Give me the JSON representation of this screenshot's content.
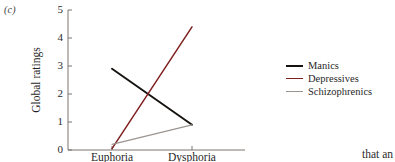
{
  "panel": {
    "label": "(c)"
  },
  "body_fragment": {
    "text": "that an"
  },
  "legend": {
    "position": "right",
    "items": [
      {
        "label": "Manics",
        "color": "#15120f",
        "key": "manics"
      },
      {
        "label": "Depressives",
        "color": "#7e2020",
        "key": "depressives"
      },
      {
        "label": "Schizophrenics",
        "color": "#9a9590",
        "key": "schizophrenics"
      }
    ]
  },
  "chart_data": {
    "type": "line",
    "title": "",
    "subtitle": "",
    "xlabel": "",
    "ylabel": "Global ratings",
    "categories": [
      "Euphoria",
      "Dysphoria"
    ],
    "x_tick_labels": [
      "Euphoria",
      "Dysphoria"
    ],
    "y_tick_labels": [
      "0",
      "1",
      "2",
      "3",
      "4",
      "5"
    ],
    "yticks": [
      0,
      1,
      2,
      3,
      4,
      5
    ],
    "ylim": [
      0,
      5
    ],
    "xlim": [
      0,
      1
    ],
    "grid": false,
    "legend_position": "right",
    "series": [
      {
        "name": "Manics",
        "color": "#15120f",
        "values": [
          2.9,
          0.9
        ]
      },
      {
        "name": "Depressives",
        "color": "#7e2020",
        "values": [
          0.05,
          4.4
        ]
      },
      {
        "name": "Schizophrenics",
        "color": "#9a9590",
        "values": [
          0.2,
          0.9
        ]
      }
    ]
  }
}
